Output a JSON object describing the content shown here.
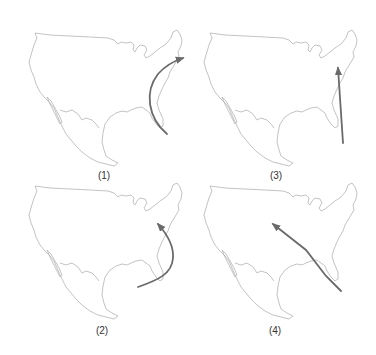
{
  "figure": {
    "panels": [
      {
        "id": 1,
        "label": "(1)",
        "arrow": "curved arrow from off Florida coast bowing west along Atlantic coast to New England"
      },
      {
        "id": 3,
        "label": "(3)",
        "arrow": "straight arrow from Atlantic south of Florida north to mid-Atlantic coast"
      },
      {
        "id": 2,
        "label": "(2)",
        "arrow": "curved arrow from Gulf/Caribbean bowing east around Florida to mid-Atlantic coast"
      },
      {
        "id": 4,
        "label": "(4)",
        "arrow": "straight arrow from south of Florida northwest into central United States"
      }
    ]
  },
  "colors": {
    "map_outline": "#b4b4b4",
    "arrow": "#6a6a6a",
    "background": "#ffffff"
  }
}
